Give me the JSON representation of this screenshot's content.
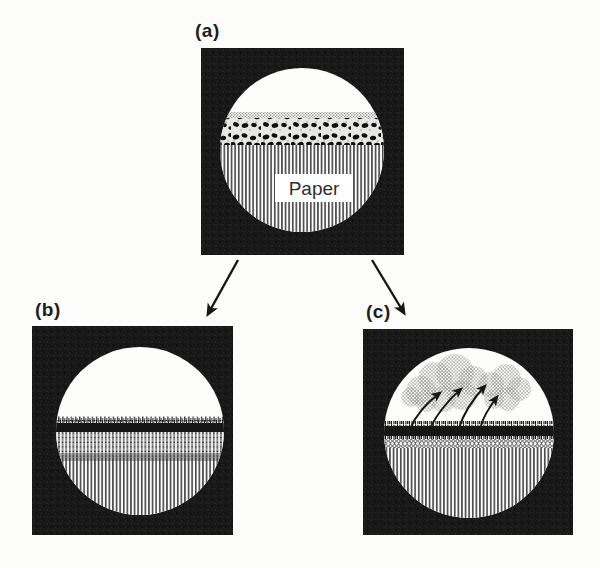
{
  "figure": {
    "panels": {
      "a": {
        "label": "(a)",
        "paper_label": "Paper"
      },
      "b": {
        "label": "(b)"
      },
      "c": {
        "label": "(c)"
      }
    },
    "colors": {
      "background": "#fcfcfb",
      "ink": "#161616",
      "circle_white": "#fdfdfb",
      "halftone_gray": "#9b9b9b"
    },
    "icons": [
      "arrow-a-to-b-icon",
      "arrow-a-to-c-icon",
      "vapor-cloud-icon",
      "evaporation-arrow-icon"
    ]
  }
}
